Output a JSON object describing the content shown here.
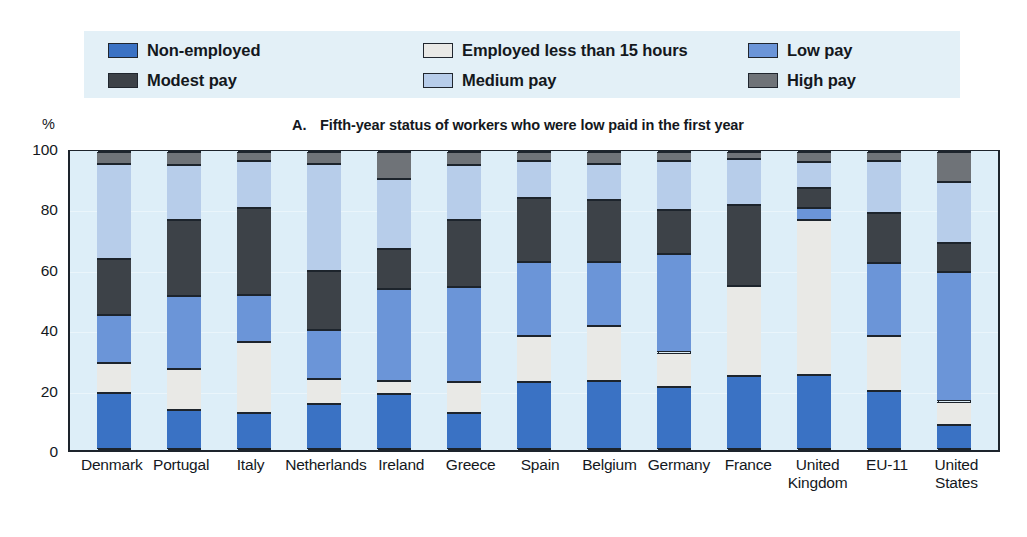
{
  "legend": {
    "items": [
      {
        "label": "Non-employed",
        "color": "#3a72c4",
        "col": 0,
        "row": 0
      },
      {
        "label": "Modest pay",
        "color": "#3d4248",
        "col": 0,
        "row": 1
      },
      {
        "label": "Employed less than 15 hours",
        "color": "#e9e9e6",
        "col": 1,
        "row": 0
      },
      {
        "label": "Medium pay",
        "color": "#b7cdea",
        "col": 1,
        "row": 1
      },
      {
        "label": "Low pay",
        "color": "#6b95d8",
        "col": 2,
        "row": 0
      },
      {
        "label": "High pay",
        "color": "#6f7378",
        "col": 2,
        "row": 1
      }
    ]
  },
  "axis": {
    "unit": "%",
    "panel_letter": "A.",
    "yticks": [
      "100",
      "80",
      "60",
      "40",
      "20",
      "0"
    ]
  },
  "chart_data": {
    "type": "bar",
    "subtype": "stacked-vertical-100pct",
    "title": "Fifth-year status of workers who were low paid in the first year",
    "panel": "A.",
    "xlabel": "",
    "ylabel": "%",
    "ylim": [
      0,
      100
    ],
    "yticks": [
      0,
      20,
      40,
      60,
      80,
      100
    ],
    "grid": true,
    "legend_position": "top",
    "categories": [
      "Denmark",
      "Portugal",
      "Italy",
      "Netherlands",
      "Ireland",
      "Greece",
      "Spain",
      "Belgium",
      "Germany",
      "France",
      "United Kingdom",
      "EU-11",
      "United States"
    ],
    "series": [
      {
        "name": "Non-employed",
        "color": "#3a72c4",
        "values": [
          19,
          13,
          12,
          15,
          18.5,
          12,
          22.5,
          23,
          21,
          24.5,
          25,
          19.5,
          8
        ]
      },
      {
        "name": "Employed less than 15 hours",
        "color": "#e9e9e6",
        "values": [
          10,
          14,
          24,
          8.5,
          4.5,
          10.5,
          15.5,
          18.5,
          11.5,
          30.5,
          52,
          18.5,
          8
        ]
      },
      {
        "name": "Low pay",
        "color": "#6b95d8",
        "values": [
          16,
          24.5,
          16,
          16.5,
          31,
          32,
          25,
          21.5,
          33,
          0,
          4,
          24.5,
          43.5
        ]
      },
      {
        "name": "Modest pay",
        "color": "#3d4248",
        "values": [
          19,
          25.5,
          29,
          20,
          13.5,
          22.5,
          21.5,
          21,
          15,
          27,
          7,
          17,
          10
        ]
      },
      {
        "name": "Medium pay",
        "color": "#b7cdea",
        "values": [
          32,
          18.5,
          16,
          36,
          23.5,
          18.5,
          12.5,
          12,
          16.5,
          15.5,
          8.5,
          17.5,
          20.5
        ]
      },
      {
        "name": "High pay",
        "color": "#6f7378",
        "values": [
          4,
          4.5,
          3,
          4,
          9,
          4.5,
          3,
          4,
          3,
          2.5,
          3.5,
          3,
          10
        ]
      }
    ]
  },
  "xlabels": [
    {
      "lines": [
        "Denmark"
      ]
    },
    {
      "lines": [
        "Portugal"
      ]
    },
    {
      "lines": [
        "Italy"
      ]
    },
    {
      "lines": [
        "Netherlands"
      ]
    },
    {
      "lines": [
        "Ireland"
      ]
    },
    {
      "lines": [
        "Greece"
      ]
    },
    {
      "lines": [
        "Spain"
      ]
    },
    {
      "lines": [
        "Belgium"
      ]
    },
    {
      "lines": [
        "Germany"
      ]
    },
    {
      "lines": [
        "France"
      ]
    },
    {
      "lines": [
        "United",
        "Kingdom"
      ]
    },
    {
      "lines": [
        "EU-11"
      ]
    },
    {
      "lines": [
        "United",
        "States"
      ]
    }
  ]
}
